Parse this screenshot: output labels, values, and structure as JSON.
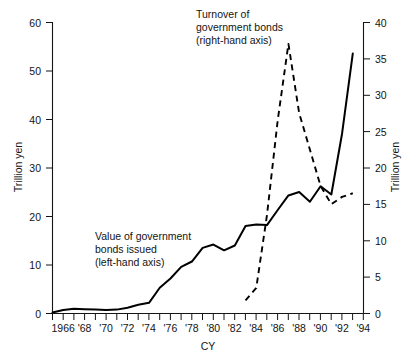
{
  "chart_data": {
    "type": "line",
    "title": "",
    "xlabel": "CY",
    "grid": false,
    "legend_position": "inline-annotations",
    "x_ticks_major": [
      "1966",
      "'68",
      "'70",
      "'72",
      "'74",
      "'76",
      "'78",
      "'80",
      "'82",
      "'84",
      "'86",
      "'88",
      "'90",
      "'92",
      "'94"
    ],
    "x_range": [
      1965,
      1994
    ],
    "x_tick_interval_years": 1,
    "x_major_interval_years": 2,
    "axes": [
      {
        "id": "left",
        "label": "Trillion yen",
        "ticks": [
          0,
          10,
          20,
          30,
          40,
          50,
          60
        ],
        "range": [
          0,
          60
        ],
        "side": "left"
      },
      {
        "id": "right",
        "label": "Trillion yen",
        "ticks": [
          0,
          5,
          10,
          15,
          20,
          25,
          30,
          35,
          40
        ],
        "range": [
          0,
          40
        ],
        "side": "right"
      }
    ],
    "series": [
      {
        "name": "Value of government bonds issued",
        "axis": "left",
        "style": "solid",
        "annotation": "Value of government\nbonds issued\n(left-hand axis)",
        "x": [
          1965,
          1966,
          1967,
          1968,
          1969,
          1970,
          1971,
          1972,
          1973,
          1974,
          1975,
          1976,
          1977,
          1978,
          1979,
          1980,
          1981,
          1982,
          1983,
          1984,
          1985,
          1986,
          1987,
          1988,
          1989,
          1990,
          1991,
          1992,
          1993
        ],
        "values": [
          0.2,
          0.7,
          1.0,
          0.9,
          0.8,
          0.7,
          0.8,
          1.2,
          1.8,
          2.2,
          5.3,
          7.2,
          9.6,
          10.7,
          13.5,
          14.2,
          13.0,
          14.0,
          18.0,
          18.3,
          18.2,
          21.3,
          24.3,
          25.0,
          23.0,
          26.2,
          24.5,
          37.0,
          53.5
        ]
      },
      {
        "name": "Turnover of government bonds",
        "axis": "right",
        "style": "dashed",
        "annotation": "Turnover of\ngovernment bonds\n(right-hand axis)",
        "x": [
          1983,
          1984,
          1985,
          1986,
          1987,
          1988,
          1989,
          1990,
          1991,
          1992,
          1993
        ],
        "values": [
          1.8,
          3.5,
          13.5,
          26.5,
          37.0,
          27.5,
          22.5,
          17.5,
          15.0,
          16.0,
          16.5
        ]
      }
    ]
  },
  "annotations": {
    "turnover": {
      "line1": "Turnover of",
      "line2": "government bonds",
      "line3": "(right-hand axis)"
    },
    "issued": {
      "line1": "Value of government",
      "line2": "bonds issued",
      "line3": "(left-hand axis)"
    }
  },
  "axis_titles": {
    "left": "Trillion yen",
    "right": "Trillion yen",
    "x": "CY"
  },
  "left_ticks": [
    "60",
    "50",
    "40",
    "30",
    "20",
    "10",
    "0"
  ],
  "right_ticks": [
    "40",
    "35",
    "30",
    "25",
    "20",
    "15",
    "10",
    "5",
    "0"
  ],
  "x_labels": [
    "1966",
    "'68",
    "'70",
    "'72",
    "'74",
    "'76",
    "'78",
    "'80",
    "'82",
    "'84",
    "'86",
    "'88",
    "'90",
    "'92",
    "'94"
  ]
}
